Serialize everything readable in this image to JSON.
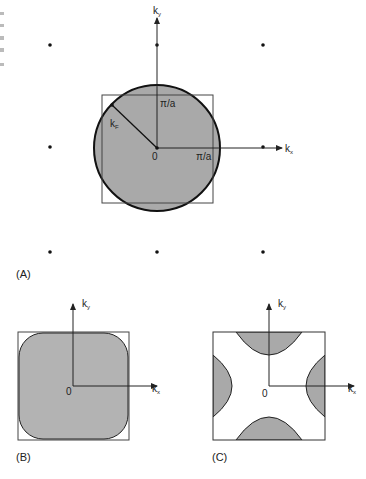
{
  "figure": {
    "panel_a": {
      "label": "(A)",
      "ky": "k",
      "ky_sub": "y",
      "kx": "k",
      "kx_sub": "x",
      "kf": "k",
      "kf_sub": "F",
      "origin": "0",
      "pi_a_top": "π/a",
      "pi_a_right": "π/a"
    },
    "panel_b": {
      "label": "(B)",
      "ky": "k",
      "ky_sub": "y",
      "kx": "k",
      "kx_sub": "x",
      "origin": "0"
    },
    "panel_c": {
      "label": "(C)",
      "ky": "k",
      "ky_sub": "y",
      "kx": "k",
      "kx_sub": "x",
      "origin": "0"
    }
  },
  "colors": {
    "fill_gray": "#a9a9a9",
    "fill_gray_light": "#b3b3b3",
    "line": "#222222",
    "square": "#444444"
  }
}
